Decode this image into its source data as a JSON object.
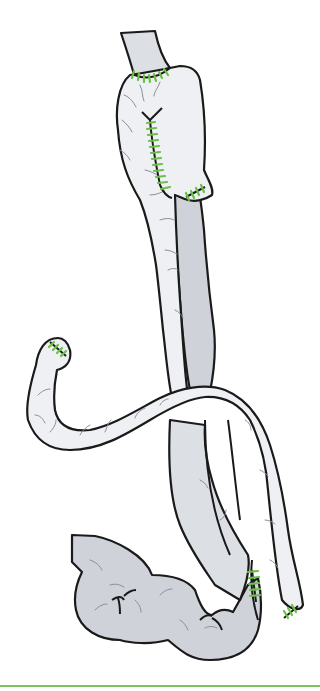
{
  "figure": {
    "colors": {
      "outline": "#1a1a1a",
      "bowel_light": "#eef0f3",
      "bowel_mid": "#dcdfe4",
      "bowel_dark": "#cfd2d8",
      "suture": "#6cc04a",
      "vessel": "#8a8f96",
      "rule": "#7cc35a"
    },
    "parts": [
      {
        "name": "esophagus"
      },
      {
        "name": "gastric-pouch"
      },
      {
        "name": "alimentary-limb"
      },
      {
        "name": "blind-loop"
      },
      {
        "name": "biliopancreatic-limb"
      },
      {
        "name": "common-channel"
      }
    ],
    "anastomoses": [
      {
        "name": "esophagogastric-anastomosis"
      },
      {
        "name": "longitudinal-staple-line"
      },
      {
        "name": "pouch-tip-closure"
      },
      {
        "name": "blind-end-closure"
      },
      {
        "name": "jejunojejunal-anastomosis"
      },
      {
        "name": "limb-end-closure"
      }
    ]
  }
}
